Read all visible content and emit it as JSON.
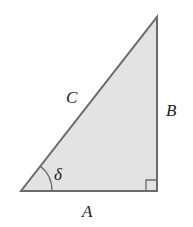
{
  "diagram": {
    "type": "right-triangle",
    "fill_color": "#e3e3e3",
    "stroke_color": "#6b6b6b",
    "labels": {
      "hypotenuse": "C",
      "vertical_side": "B",
      "base": "A",
      "angle": "δ"
    },
    "right_angle_marker": true
  }
}
